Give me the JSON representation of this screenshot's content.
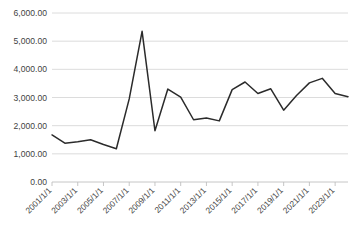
{
  "chart_data": {
    "type": "line",
    "title": "",
    "xlabel": "",
    "ylabel": "",
    "ylim": [
      0,
      6000
    ],
    "grid": true,
    "legend": "none",
    "y_tick_labels": [
      "6,000.00",
      "5,000.00",
      "4,000.00",
      "3,000.00",
      "2,000.00",
      "1,000.00",
      "0.00"
    ],
    "y_tick_values": [
      6000,
      5000,
      4000,
      3000,
      2000,
      1000,
      0
    ],
    "x_tick_labels": [
      "2001/1/1",
      "2003/1/1",
      "2005/1/1",
      "2007/1/1",
      "2009/1/1",
      "2011/1/1",
      "2013/1/1",
      "2015/1/1",
      "2017/1/1",
      "2019/1/1",
      "2021/1/1",
      "2023/1/1"
    ],
    "x": [
      "2001/1/1",
      "2002/1/1",
      "2003/1/1",
      "2004/1/1",
      "2005/1/1",
      "2006/1/1",
      "2007/1/1",
      "2008/1/1",
      "2009/1/1",
      "2010/1/1",
      "2011/1/1",
      "2012/1/1",
      "2013/1/1",
      "2014/1/1",
      "2015/1/1",
      "2016/1/1",
      "2017/1/1",
      "2018/1/1",
      "2019/1/1",
      "2020/1/1",
      "2021/1/1",
      "2022/1/1",
      "2023/1/1",
      "2024/1/1"
    ],
    "values": [
      1670,
      1380,
      1430,
      1500,
      1330,
      1180,
      2950,
      5350,
      1820,
      3300,
      3010,
      2210,
      2270,
      2170,
      3280,
      3550,
      3140,
      3310,
      2550,
      3070,
      3520,
      3680,
      3140,
      3030
    ],
    "series": [
      {
        "name": "series-1",
        "color": "#2b2b2b",
        "values": [
          1670,
          1380,
          1430,
          1500,
          1330,
          1180,
          2950,
          5350,
          1820,
          3300,
          3010,
          2210,
          2270,
          2170,
          3280,
          3550,
          3140,
          3310,
          2550,
          3070,
          3520,
          3680,
          3140,
          3030
        ]
      }
    ]
  },
  "colors": {
    "line": "#2b2b2b",
    "gridline": "#d3d3d3",
    "axis": "#bfbfbf",
    "tick_text": "#3f3f3f",
    "background": "#ffffff"
  }
}
